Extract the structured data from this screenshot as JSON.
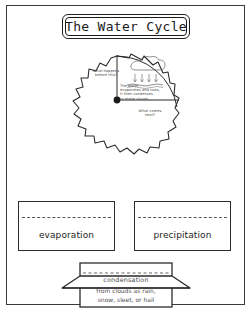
{
  "worksheet": {
    "title": "The Water Cycle"
  },
  "wheel": {
    "labels": {
      "before": "What happens\nbefore this?",
      "explain": "The water\nevaporates and rises,\nit then condenses\nto make clouds.",
      "next": "What comes\nnext?"
    },
    "illustration": "cloud-with-rain-icon"
  },
  "flaps": [
    {
      "id": "evaporation",
      "label": "evaporation"
    },
    {
      "id": "precipitation",
      "label": "precipitation"
    }
  ],
  "condensation": {
    "title": "condensation",
    "line1": "from clouds as rain,",
    "line2": "snow, sleet, or hail"
  },
  "colors": {
    "ink": "#1a1a1a",
    "line": "#2b2b2b",
    "faint_text": "#4a4a4a",
    "page_border": "#3a3a3a",
    "paper": "#ffffff"
  }
}
